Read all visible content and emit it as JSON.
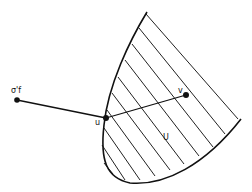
{
  "figure": {
    "labels": {
      "external_point": "σ'f",
      "boundary_point": "u",
      "interior_point": "v",
      "set": "U"
    },
    "colors": {
      "ink": "#111111",
      "background": "#ffffff"
    }
  }
}
